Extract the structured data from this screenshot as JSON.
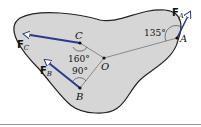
{
  "diagram": {
    "points": {
      "A": {
        "label": "A"
      },
      "B": {
        "label": "B"
      },
      "C": {
        "label": "C"
      },
      "O": {
        "label": "O"
      }
    },
    "forces": {
      "FA": {
        "label": "F",
        "sub": "A"
      },
      "FB": {
        "label": "F",
        "sub": "B"
      },
      "FC": {
        "label": "F",
        "sub": "C"
      }
    },
    "angles": {
      "at_A": "135°",
      "at_C": "160°",
      "at_B": "90°"
    },
    "colors": {
      "body_fill": "#d6d6d6",
      "outline": "#222222",
      "force_arrow": "#2a3a8c",
      "rule_line": "#8a8fc8"
    }
  }
}
